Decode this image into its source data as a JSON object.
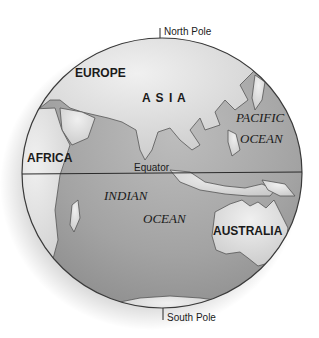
{
  "map": {
    "poles": {
      "north": "North Pole",
      "south": "South Pole"
    },
    "equator": "Equator",
    "continents": {
      "europe": "EUROPE",
      "asia": "A S I A",
      "africa": "AFRICA",
      "australia": "AUSTRALIA"
    },
    "oceans": {
      "pacific_line1": "PACIFIC",
      "pacific_line2": "OCEAN",
      "indian_line1": "INDIAN",
      "indian_line2": "OCEAN"
    },
    "colors": {
      "ocean": "#9a9a9a",
      "land": "#d9d9d9",
      "outline": "#4a4a4a",
      "text": "#1a1a1a"
    }
  }
}
